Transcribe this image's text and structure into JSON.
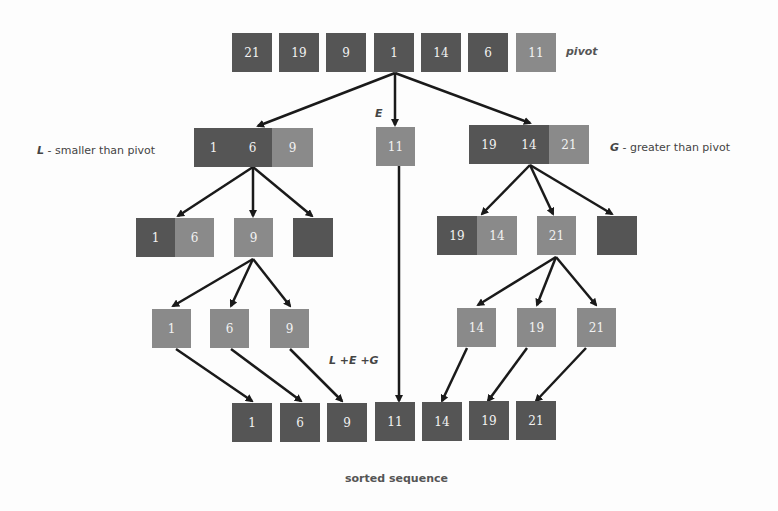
{
  "diagram": {
    "type": "quicksort-partition",
    "input": {
      "values": [
        "21",
        "19",
        "9",
        "1",
        "14",
        "6",
        "11"
      ],
      "pivot_label": "pivot"
    },
    "partitions": {
      "L": {
        "letter": "L",
        "desc": " - smaller than pivot",
        "values": [
          "1",
          "6",
          "9"
        ]
      },
      "E": {
        "letter": "E",
        "values": [
          "11"
        ]
      },
      "G": {
        "letter": "G",
        "desc": " - greater than pivot",
        "values": [
          "19",
          "14",
          "21"
        ]
      }
    },
    "left_sub": {
      "pair": [
        "1",
        "6"
      ],
      "pivot": "9",
      "empty": ""
    },
    "right_sub": {
      "pair": [
        "19",
        "14"
      ],
      "pivot": "21",
      "empty": ""
    },
    "left_leaves": [
      "1",
      "6",
      "9"
    ],
    "right_leaves": [
      "14",
      "19",
      "21"
    ],
    "concat_label": "L +E +G",
    "output": {
      "values": [
        "1",
        "6",
        "9",
        "11",
        "14",
        "19",
        "21"
      ],
      "label": "sorted sequence"
    },
    "colors": {
      "dark": "#555555",
      "light": "#8a8a8a",
      "arrow": "#1a1a1a"
    }
  }
}
